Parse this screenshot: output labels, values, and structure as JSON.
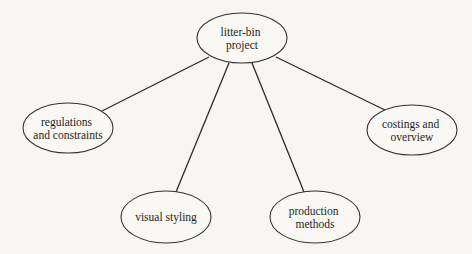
{
  "diagram": {
    "type": "mind-map",
    "colors": {
      "background": "#f7f6f2",
      "line": "#2a2a2a",
      "node_stroke": "#333333",
      "text": "#1e1e1e"
    },
    "root": {
      "id": "root",
      "lines": [
        "litter-bin",
        "project"
      ],
      "cx": 242,
      "cy": 38,
      "rx": 45,
      "ry": 25
    },
    "children": [
      {
        "id": "regulations",
        "lines": [
          "regulations",
          "and constraints"
        ],
        "cx": 68,
        "cy": 128,
        "rx": 45,
        "ry": 25,
        "edge": {
          "x1": 209,
          "y1": 57,
          "x2": 102,
          "y2": 111
        }
      },
      {
        "id": "visual-styling",
        "lines": [
          "visual styling"
        ],
        "cx": 166,
        "cy": 217,
        "rx": 45,
        "ry": 26,
        "edge": {
          "x1": 229,
          "y1": 63,
          "x2": 176,
          "y2": 192
        }
      },
      {
        "id": "production",
        "lines": [
          "production",
          "methods"
        ],
        "cx": 315,
        "cy": 217,
        "rx": 45,
        "ry": 26,
        "edge": {
          "x1": 252,
          "y1": 63,
          "x2": 304,
          "y2": 192
        }
      },
      {
        "id": "costings",
        "lines": [
          "costings and",
          "overview"
        ],
        "cx": 412,
        "cy": 130,
        "rx": 45,
        "ry": 25,
        "edge": {
          "x1": 276,
          "y1": 57,
          "x2": 389,
          "y2": 112
        }
      }
    ]
  }
}
